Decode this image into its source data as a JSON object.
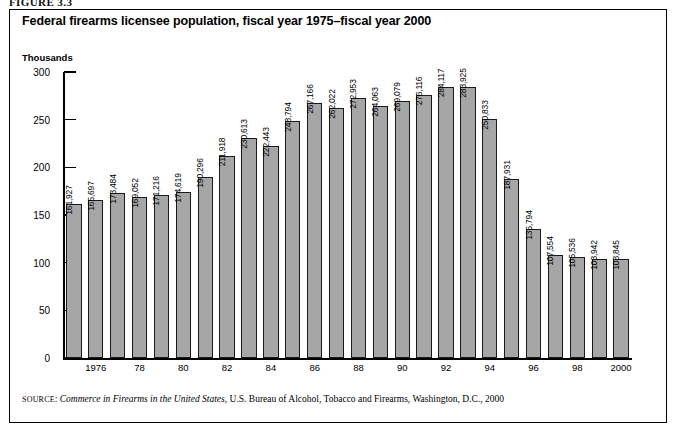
{
  "figure_head": "FIGURE 3.3",
  "title": "Federal firearms licensee population, fiscal year 1975–fiscal year 2000",
  "units_label": "Thousands",
  "source": {
    "prefix": "SOURCE",
    "italic_title": "Commerce in Firearms in the United States",
    "rest": ", U.S. Bureau of Alcohol, Tobacco and Firearms, Washington, D.C., 2000"
  },
  "colors": {
    "bar_fill": "#a6a6a6",
    "bar_stroke": "#1a1a1a",
    "frame": "#000000",
    "text": "#000000"
  },
  "chart_data": {
    "type": "bar",
    "title": "Federal firearms licensee population, fiscal year 1975–fiscal year 2000",
    "xlabel": "",
    "ylabel": "Thousands",
    "ylim": [
      0,
      300
    ],
    "yticks": [
      0,
      50,
      100,
      150,
      200,
      250,
      300
    ],
    "ytick_labels": [
      "0",
      "50",
      "100",
      "150",
      "200",
      "250",
      "300"
    ],
    "grid": false,
    "legend": null,
    "value_unit": "licensees",
    "x": [
      1975,
      1976,
      1977,
      1978,
      1979,
      1980,
      1981,
      1982,
      1983,
      1984,
      1985,
      1986,
      1987,
      1988,
      1989,
      1990,
      1991,
      1992,
      1993,
      1994,
      1995,
      1996,
      1997,
      1998,
      1999,
      2000
    ],
    "xtick_labels": [
      "",
      "1976",
      "",
      "78",
      "",
      "80",
      "",
      "82",
      "",
      "84",
      "",
      "86",
      "",
      "88",
      "",
      "90",
      "",
      "92",
      "",
      "94",
      "",
      "96",
      "",
      "98",
      "",
      "2000"
    ],
    "values": [
      161927,
      165697,
      173484,
      169052,
      171216,
      174619,
      190296,
      211918,
      230613,
      222443,
      248794,
      267166,
      262022,
      272953,
      264063,
      269079,
      276116,
      284117,
      283925,
      250833,
      187931,
      135794,
      107554,
      105536,
      103942,
      103845
    ],
    "value_labels": [
      "161,927",
      "165,697",
      "173,484",
      "169,052",
      "171,216",
      "174,619",
      "190,296",
      "211,918",
      "230,613",
      "222,443",
      "248,794",
      "267,166",
      "262,022",
      "272,953",
      "264,063",
      "269,079",
      "276,116",
      "284,117",
      "283,925",
      "250,833",
      "187,931",
      "135,794",
      "107,554",
      "105,536",
      "103,942",
      "103,845"
    ]
  }
}
